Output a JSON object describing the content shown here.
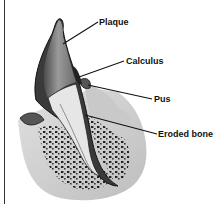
{
  "diagram": {
    "labels": [
      {
        "id": "plaque",
        "text": "Plaque",
        "x": 99,
        "y": 17,
        "line": [
          63,
          44,
          98,
          22
        ]
      },
      {
        "id": "calculus",
        "text": "Calculus",
        "x": 126,
        "y": 56,
        "line": [
          79,
          77,
          124,
          61
        ]
      },
      {
        "id": "pus",
        "text": "Pus",
        "x": 154,
        "y": 94,
        "line": [
          88,
          85,
          152,
          99
        ]
      },
      {
        "id": "eroded-bone",
        "text": "Eroded bone",
        "x": 158,
        "y": 129,
        "line": [
          85,
          115,
          157,
          134
        ]
      }
    ],
    "colors": {
      "ink": "#111111",
      "enamel_dark": "#3a3a3a",
      "root_light": "#e8e8e8",
      "gum": "#bdbdbd",
      "bone_dots": "#222222"
    }
  }
}
